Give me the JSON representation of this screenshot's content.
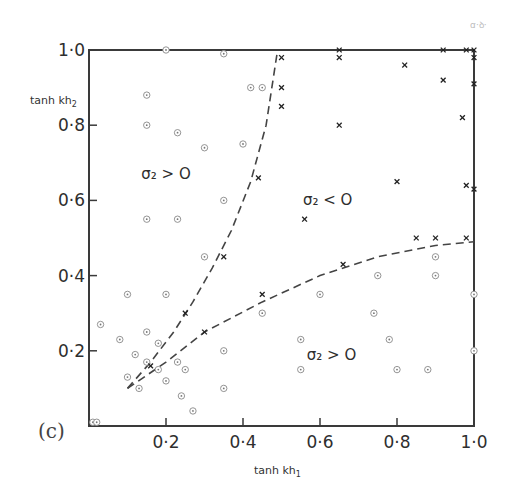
{
  "panel_label": "(c)",
  "axes": {
    "x_title_main": "tanh kh",
    "x_title_sub": "1",
    "y_title_main": "tanh kh",
    "y_title_sub": "2",
    "x_ticks": [
      "0·2",
      "0·4",
      "0·6",
      "0·8",
      "1·0"
    ],
    "y_ticks": [
      "0·2",
      "0·4",
      "0·6",
      "0·8",
      "1·0"
    ]
  },
  "regions": [
    {
      "label": "σ₂ > O",
      "x": 0.2,
      "y": 0.67
    },
    {
      "label": "σ₂ < O",
      "x": 0.62,
      "y": 0.6
    },
    {
      "label": "σ₂ > O",
      "x": 0.63,
      "y": 0.19
    }
  ],
  "legend": {
    "stable_marker": "circled dot (σ₂ > 0, stable)",
    "unstable_marker": "cross (σ₂ < 0, unstable)"
  },
  "chart_data": {
    "type": "scatter",
    "title": "",
    "panel": "(c)",
    "xlabel": "tanh kh1",
    "ylabel": "tanh kh2",
    "xlim": [
      0,
      1.0
    ],
    "ylim": [
      0,
      1.0
    ],
    "x_ticks": [
      0.2,
      0.4,
      0.6,
      0.8,
      1.0
    ],
    "y_ticks": [
      0.2,
      0.4,
      0.6,
      0.8,
      1.0
    ],
    "grid": false,
    "legend_position": "none",
    "region_annotations": [
      {
        "text": "σ2 > 0",
        "x": 0.2,
        "y": 0.67
      },
      {
        "text": "σ2 < 0",
        "x": 0.62,
        "y": 0.6
      },
      {
        "text": "σ2 > 0",
        "x": 0.63,
        "y": 0.19
      }
    ],
    "series": [
      {
        "name": "σ2 > 0 (circled points)",
        "marker": "circled-dot",
        "points": [
          [
            0.2,
            1.0
          ],
          [
            0.35,
            0.99
          ],
          [
            0.15,
            0.88
          ],
          [
            0.42,
            0.9
          ],
          [
            0.45,
            0.9
          ],
          [
            0.15,
            0.8
          ],
          [
            0.23,
            0.78
          ],
          [
            0.3,
            0.74
          ],
          [
            0.4,
            0.75
          ],
          [
            0.35,
            0.6
          ],
          [
            0.15,
            0.55
          ],
          [
            0.23,
            0.55
          ],
          [
            0.3,
            0.45
          ],
          [
            0.1,
            0.35
          ],
          [
            0.2,
            0.35
          ],
          [
            0.03,
            0.27
          ],
          [
            0.08,
            0.23
          ],
          [
            0.15,
            0.25
          ],
          [
            0.18,
            0.22
          ],
          [
            0.12,
            0.19
          ],
          [
            0.35,
            0.2
          ],
          [
            0.15,
            0.17
          ],
          [
            0.18,
            0.15
          ],
          [
            0.23,
            0.17
          ],
          [
            0.25,
            0.15
          ],
          [
            0.1,
            0.13
          ],
          [
            0.13,
            0.1
          ],
          [
            0.2,
            0.12
          ],
          [
            0.35,
            0.1
          ],
          [
            0.24,
            0.08
          ],
          [
            0.27,
            0.04
          ],
          [
            0.01,
            0.01
          ],
          [
            0.02,
            0.01
          ],
          [
            0.45,
            0.3
          ],
          [
            0.6,
            0.35
          ],
          [
            0.75,
            0.4
          ],
          [
            0.9,
            0.45
          ],
          [
            0.9,
            0.4
          ],
          [
            1.0,
            0.35
          ],
          [
            0.74,
            0.3
          ],
          [
            0.55,
            0.23
          ],
          [
            0.78,
            0.23
          ],
          [
            1.0,
            0.2
          ],
          [
            0.55,
            0.15
          ],
          [
            0.8,
            0.15
          ],
          [
            0.88,
            0.15
          ]
        ]
      },
      {
        "name": "σ2 < 0 (crosses)",
        "marker": "x",
        "points": [
          [
            0.5,
            0.98
          ],
          [
            0.65,
            1.0
          ],
          [
            0.65,
            0.98
          ],
          [
            0.82,
            0.96
          ],
          [
            0.92,
            1.0
          ],
          [
            0.98,
            1.0
          ],
          [
            1.0,
            1.0
          ],
          [
            1.0,
            0.98
          ],
          [
            0.5,
            0.9
          ],
          [
            0.5,
            0.85
          ],
          [
            0.92,
            0.92
          ],
          [
            1.0,
            0.91
          ],
          [
            0.65,
            0.8
          ],
          [
            0.97,
            0.82
          ],
          [
            0.44,
            0.66
          ],
          [
            0.8,
            0.65
          ],
          [
            0.98,
            0.64
          ],
          [
            1.0,
            0.63
          ],
          [
            0.56,
            0.55
          ],
          [
            0.35,
            0.45
          ],
          [
            0.85,
            0.5
          ],
          [
            0.9,
            0.5
          ],
          [
            0.98,
            0.5
          ],
          [
            0.66,
            0.43
          ],
          [
            0.45,
            0.35
          ],
          [
            0.25,
            0.3
          ],
          [
            0.3,
            0.25
          ],
          [
            0.16,
            0.16
          ]
        ]
      },
      {
        "name": "boundary curve (upper, dashed)",
        "marker": "dashed-line",
        "points": [
          [
            0.1,
            0.1
          ],
          [
            0.16,
            0.17
          ],
          [
            0.22,
            0.25
          ],
          [
            0.27,
            0.33
          ],
          [
            0.32,
            0.42
          ],
          [
            0.37,
            0.52
          ],
          [
            0.42,
            0.65
          ],
          [
            0.46,
            0.8
          ],
          [
            0.49,
            1.0
          ]
        ]
      },
      {
        "name": "boundary curve (lower, dashed)",
        "marker": "dashed-line",
        "points": [
          [
            0.1,
            0.1
          ],
          [
            0.2,
            0.17
          ],
          [
            0.3,
            0.25
          ],
          [
            0.45,
            0.33
          ],
          [
            0.6,
            0.4
          ],
          [
            0.75,
            0.45
          ],
          [
            0.9,
            0.48
          ],
          [
            1.0,
            0.49
          ]
        ]
      }
    ]
  }
}
